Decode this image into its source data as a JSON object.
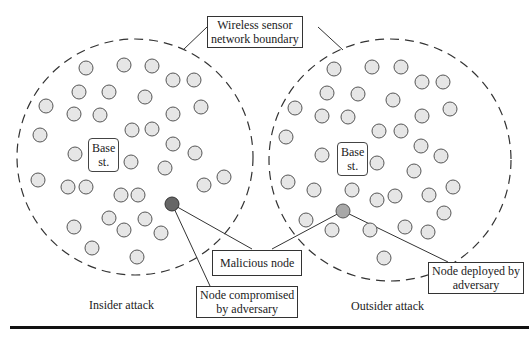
{
  "diagram": {
    "boundary_label": "Wireless sensor network boundary",
    "boundary_label_lines": [
      "Wireless sensor",
      "network boundary"
    ],
    "malicious_label": "Malicious node",
    "insider": {
      "caption": "Insider attack",
      "base_station_lines": [
        "Base",
        "st."
      ],
      "annotation_lines": [
        "Node compromised",
        "by adversary"
      ]
    },
    "outsider": {
      "caption": "Outsider attack",
      "base_station_lines": [
        "Base",
        "st."
      ],
      "annotation_lines": [
        "Node deployed by",
        "adversary"
      ]
    },
    "colors": {
      "node_fill": "#e6e6e6",
      "node_stroke": "#555555",
      "compromised_node_fill": "#666666",
      "deployed_node_fill": "#a8a8a8",
      "boundary_stroke": "#333333"
    }
  }
}
